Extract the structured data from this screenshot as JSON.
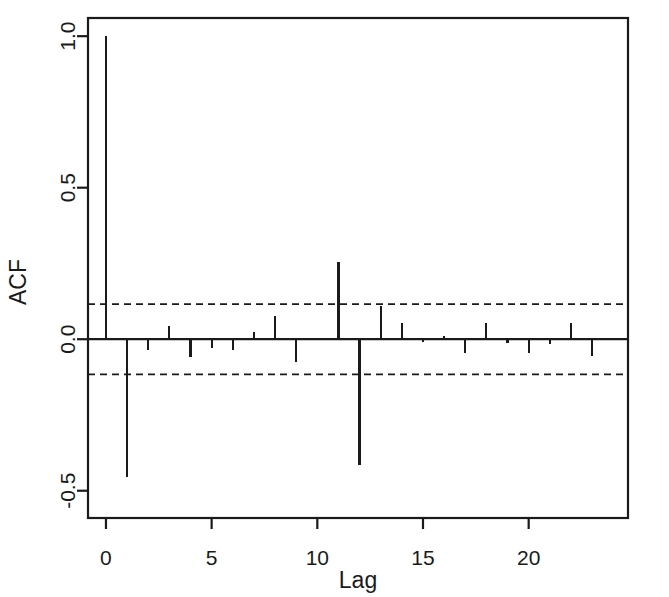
{
  "chart_data": {
    "type": "bar",
    "title": "",
    "subtitle": "",
    "xlabel": "Lag",
    "ylabel": "ACF",
    "x": [
      0,
      1,
      2,
      3,
      4,
      5,
      6,
      7,
      8,
      9,
      10,
      11,
      12,
      13,
      14,
      15,
      16,
      17,
      18,
      19,
      20,
      21,
      22,
      23
    ],
    "categories": [
      "0",
      "1",
      "2",
      "3",
      "4",
      "5",
      "6",
      "7",
      "8",
      "9",
      "10",
      "11",
      "12",
      "13",
      "14",
      "15",
      "16",
      "17",
      "18",
      "19",
      "20",
      "21",
      "22",
      "23"
    ],
    "values": [
      1.0,
      -0.455,
      -0.035,
      0.045,
      -0.06,
      -0.03,
      -0.035,
      0.025,
      0.075,
      -0.075,
      0.0,
      0.256,
      -0.415,
      0.11,
      0.055,
      -0.01,
      0.012,
      -0.045,
      0.055,
      -0.012,
      -0.045,
      -0.015,
      0.055,
      -0.055
    ],
    "series": [
      {
        "name": "ACF",
        "values": [
          1.0,
          -0.455,
          -0.035,
          0.045,
          -0.06,
          -0.03,
          -0.035,
          0.025,
          0.075,
          -0.075,
          0.0,
          0.256,
          -0.415,
          0.11,
          0.055,
          -0.01,
          0.012,
          -0.045,
          0.055,
          -0.012,
          -0.045,
          -0.015,
          0.055,
          -0.055
        ]
      }
    ],
    "xlim": [
      -0.85,
      24.7
    ],
    "ylim": [
      -0.59,
      1.06
    ],
    "xticks": [
      0,
      5,
      10,
      15,
      20
    ],
    "xtick_labels": [
      "0",
      "5",
      "10",
      "15",
      "20"
    ],
    "yticks": [
      -0.5,
      0.0,
      0.5,
      1.0
    ],
    "ytick_labels": [
      "-0.5",
      "0.0",
      "0.5",
      "1.0"
    ],
    "grid": false,
    "legend": false,
    "legend_position": "none",
    "annotations": [
      {
        "name": "upper-confidence-band",
        "type": "hline",
        "value": 0.116,
        "style": "dashed"
      },
      {
        "name": "lower-confidence-band",
        "type": "hline",
        "value": -0.116,
        "style": "dashed"
      },
      {
        "name": "zero-baseline",
        "type": "hline",
        "value": 0.0,
        "style": "solid"
      }
    ],
    "colors": {
      "axis": "#1a1a1a",
      "bars": "#1a1a1a",
      "confidence": "#1a1a1a",
      "background": "#ffffff"
    }
  }
}
